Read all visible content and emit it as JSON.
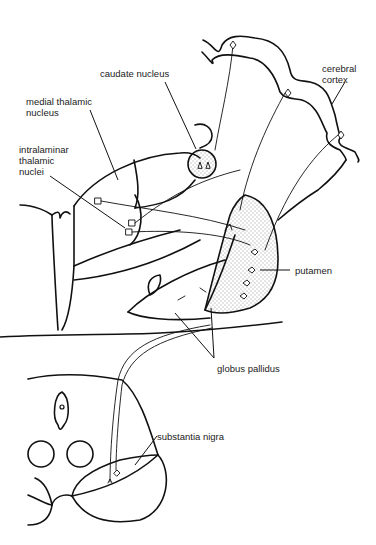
{
  "figure": {
    "type": "anatomical line drawing",
    "line_color": "#111111",
    "background": "#ffffff"
  },
  "labels": {
    "caudate_nucleus": "caudate nucleus",
    "cerebral_cortex": "cerebral\ncortex",
    "medial_thalamic_nucleus": "medial thalamic\nnucleus",
    "intralaminar_thalamic_nuclei": "intralaminar\nthalamic\nnuclei",
    "putamen": "putamen",
    "globus_pallidus": "globus pallidus",
    "substantia_nigra": "substantia nigra"
  }
}
